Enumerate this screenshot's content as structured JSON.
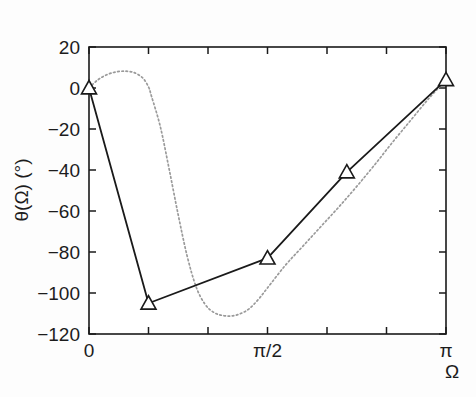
{
  "chart_data": {
    "type": "line",
    "title": "",
    "xlabel": "Ω",
    "ylabel": "θ(Ω) (°)",
    "xlim": [
      0,
      3.14159265
    ],
    "ylim": [
      -120,
      20
    ],
    "grid": false,
    "legend": "none",
    "x_tick_labels": [
      "0",
      "π/2",
      "π"
    ],
    "x_tick_values": [
      0,
      1.5707963,
      3.14159265
    ],
    "x_minor_tick_values": [
      0.5235988,
      1.0471976,
      2.0943951,
      2.6179939
    ],
    "y_tick_labels": [
      "20",
      "0",
      "−20",
      "−40",
      "−60",
      "−80",
      "−100",
      "−120"
    ],
    "y_tick_values": [
      20,
      0,
      -20,
      -40,
      -60,
      -80,
      -100,
      -120
    ],
    "series": [
      {
        "name": "designed-phase-markers",
        "style": "solid-with-triangle-markers",
        "color": "#1a1a1a",
        "marker": "triangle-up-open",
        "x": [
          0.0,
          0.5235988,
          1.5707963,
          2.268928,
          3.14159265
        ],
        "y": [
          0,
          -105,
          -83,
          -41,
          4
        ]
      },
      {
        "name": "ideal-phase-response",
        "style": "dotted",
        "color": "#9a9a9a",
        "marker": "none",
        "x": [
          0.0,
          0.0785,
          0.1571,
          0.2356,
          0.3142,
          0.3927,
          0.4712,
          0.5236,
          0.5498,
          0.6283,
          0.7069,
          0.7854,
          0.8639,
          0.9425,
          1.021,
          1.0996,
          1.1781,
          1.2566,
          1.3352,
          1.4137,
          1.4923,
          1.5708,
          1.7279,
          1.885,
          2.042,
          2.1991,
          2.3562,
          2.5133,
          2.6704,
          2.8274,
          2.9845,
          3.1416
        ],
        "y": [
          0,
          4.0,
          6.5,
          7.8,
          8.2,
          7.6,
          5.0,
          0.5,
          -4.0,
          -19.0,
          -40.0,
          -62.0,
          -82.0,
          -97.0,
          -105.5,
          -109.5,
          -111.0,
          -111.2,
          -110.0,
          -107.5,
          -103.0,
          -97.5,
          -86.5,
          -77.0,
          -67.5,
          -58.0,
          -48.0,
          -37.5,
          -26.5,
          -16.0,
          -5.5,
          4.0
        ]
      }
    ],
    "markers_note": "open upward triangles at each designed-phase sample point"
  },
  "figure": {
    "background_color": "#fdfdfd",
    "axis_color": "#1a1a1a",
    "solid_series_color": "#1a1a1a",
    "dotted_series_color": "#9a9a9a"
  }
}
